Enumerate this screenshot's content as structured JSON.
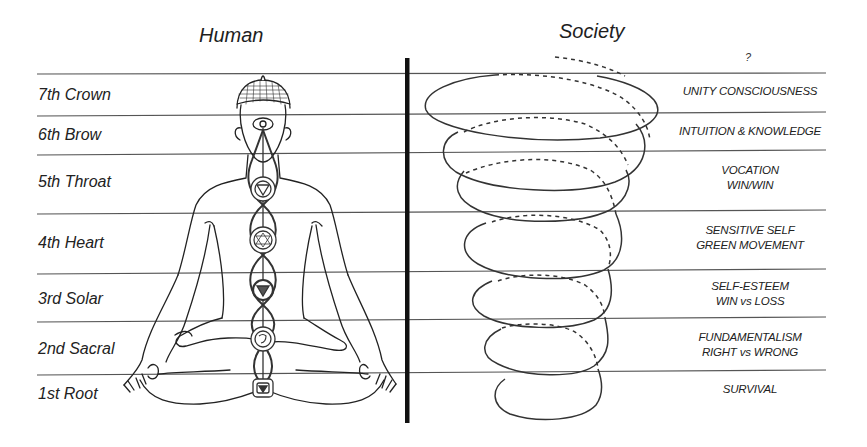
{
  "headers": {
    "left": "Human",
    "right": "Society"
  },
  "top_marker": "?",
  "levels": [
    {
      "chakra": "7th Crown",
      "stage": [
        "UNITY CONSCIOUSNESS"
      ]
    },
    {
      "chakra": "6th Brow",
      "stage": [
        "INTUITION & KNOWLEDGE"
      ]
    },
    {
      "chakra": "5th Throat",
      "stage": [
        "VOCATION",
        "WIN/WIN"
      ]
    },
    {
      "chakra": "4th Heart",
      "stage": [
        "SENSITIVE SELF",
        "GREEN MOVEMENT"
      ]
    },
    {
      "chakra": "3rd Solar",
      "stage": [
        "SELF-ESTEEM",
        "WIN vs LOSS"
      ]
    },
    {
      "chakra": "2nd Sacral",
      "stage": [
        "FUNDAMENTALISM",
        "RIGHT vs WRONG"
      ]
    },
    {
      "chakra": "1st Root",
      "stage": [
        "SURVIVAL"
      ]
    }
  ],
  "colors": {
    "ink": "#222222",
    "line": "#555555",
    "divider": "#111111",
    "background": "#ffffff"
  }
}
